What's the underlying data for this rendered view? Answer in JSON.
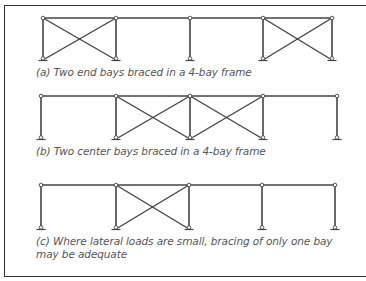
{
  "colors": {
    "line": "#444444",
    "caption": "#555555",
    "border": "#333333"
  },
  "frames": [
    {
      "id": "a",
      "caption": "(a) Two end bays braced in a 4-bay frame",
      "columns_x": [
        43,
        116,
        190,
        263,
        332
      ],
      "top_y": 18,
      "base_y": 60,
      "braced_bays": [
        0,
        3
      ]
    },
    {
      "id": "b",
      "caption": "(b) Two center bays braced in a 4-bay frame",
      "columns_x": [
        41,
        116,
        190,
        263,
        337
      ],
      "top_y": 96,
      "base_y": 139,
      "braced_bays": [
        1,
        2
      ]
    },
    {
      "id": "c",
      "caption": "(c) Where lateral loads are small, bracing of only one bay may be adequate",
      "columns_x": [
        41,
        116,
        189,
        262,
        335
      ],
      "top_y": 185,
      "base_y": 229,
      "braced_bays": [
        1
      ]
    }
  ]
}
